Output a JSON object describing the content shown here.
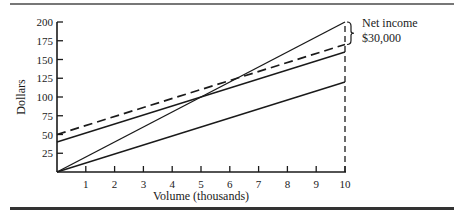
{
  "chart_data": {
    "type": "line",
    "title": "",
    "xlabel": "Volume (thousands)",
    "ylabel": "Dollars",
    "xlim": [
      0,
      10
    ],
    "ylim": [
      0,
      200
    ],
    "x_ticks": [
      1,
      2,
      3,
      4,
      5,
      6,
      7,
      8,
      9,
      10
    ],
    "y_ticks": [
      25,
      50,
      75,
      100,
      125,
      150,
      175,
      200
    ],
    "grid": false,
    "legend": null,
    "series": [
      {
        "name": "Revenue",
        "style": "solid",
        "x": [
          0,
          10
        ],
        "values": [
          0,
          200
        ]
      },
      {
        "name": "Cost (higher fixed)",
        "style": "dashed",
        "x": [
          0,
          10
        ],
        "values": [
          50,
          170
        ]
      },
      {
        "name": "Cost",
        "style": "solid",
        "x": [
          0,
          10
        ],
        "values": [
          40,
          160
        ]
      },
      {
        "name": "Variable cost",
        "style": "solid",
        "x": [
          0,
          10
        ],
        "values": [
          0,
          120
        ]
      }
    ],
    "annotations": [
      {
        "text": "Net income",
        "x": 10,
        "y": 200
      },
      {
        "text": "$30,000",
        "x": 10,
        "y": 185,
        "brace_range": [
          170,
          200
        ]
      }
    ],
    "reference_lines": [
      {
        "type": "vertical",
        "x": 10,
        "style": "dashed",
        "from": 0,
        "to": 200
      }
    ]
  },
  "labels": {
    "x_axis": "Volume (thousands)",
    "y_axis": "Dollars",
    "annotation_line1": "Net income",
    "annotation_line2": "$30,000",
    "x_ticks": [
      "1",
      "2",
      "3",
      "4",
      "5",
      "6",
      "7",
      "8",
      "9",
      "10"
    ],
    "y_ticks": [
      "25",
      "50",
      "75",
      "100",
      "125",
      "150",
      "175",
      "200"
    ]
  }
}
